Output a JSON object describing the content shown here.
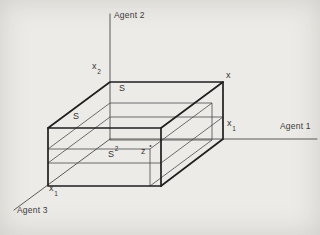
{
  "figure": {
    "colors": {
      "paper": "#edebe8",
      "ink": "#1f1f1f",
      "thin_ink": "#4a4a4a",
      "label": "#333333"
    },
    "axes": [
      {
        "id": "agent1",
        "label": "Agent 1",
        "direction": "horizontal-right"
      },
      {
        "id": "agent2",
        "label": "Agent 2",
        "direction": "vertical-up"
      },
      {
        "id": "agent3",
        "label": "Agent 3",
        "direction": "diagonal-down-left"
      }
    ],
    "labels": {
      "agent1": "Agent 1",
      "agent2": "Agent 2",
      "agent3": "Agent 3",
      "x": "x",
      "x1_right": {
        "base": "x",
        "sub": "1"
      },
      "x2": {
        "base": "x",
        "sub": "2"
      },
      "x1_bottom": {
        "base": "x",
        "sub": "1"
      },
      "s_top": "S",
      "s_left": "S",
      "s2": {
        "base": "S",
        "sup": "2"
      },
      "z": "z"
    }
  }
}
